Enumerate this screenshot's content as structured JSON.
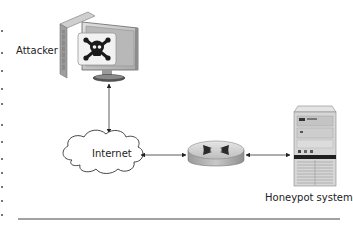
{
  "diagram": {
    "nodes": {
      "attacker": {
        "label": "Attacker",
        "icon": "computer-skull-icon"
      },
      "internet": {
        "label": "Internet",
        "icon": "cloud-icon"
      },
      "router": {
        "label": "",
        "icon": "router-icon"
      },
      "honeypot": {
        "label": "Honeypot system",
        "icon": "server-tower-icon"
      }
    },
    "edges": [
      {
        "from": "attacker",
        "to": "internet",
        "direction": "both"
      },
      {
        "from": "internet",
        "to": "router",
        "direction": "both"
      },
      {
        "from": "router",
        "to": "honeypot",
        "direction": "both"
      }
    ],
    "colors": {
      "stroke": "#333333",
      "device_light": "#d9d9d9",
      "device_mid": "#a8a8a8",
      "device_dark": "#555555",
      "background": "#ffffff"
    }
  }
}
